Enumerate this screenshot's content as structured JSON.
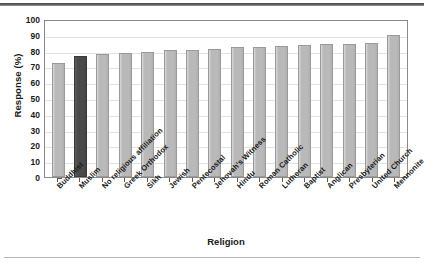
{
  "chart_data": {
    "type": "bar",
    "title": "",
    "xlabel": "Religion",
    "ylabel": "Response (%)",
    "ylim": [
      0,
      100
    ],
    "ytick_step": 10,
    "yticks": [
      100,
      90,
      80,
      70,
      60,
      50,
      40,
      30,
      20,
      10,
      0
    ],
    "grid": true,
    "legend": "none",
    "bar_color": "#b9b9b9",
    "highlight_color": "#4a4a4a",
    "highlight_category": "Muslim",
    "categories": [
      "Buddhist",
      "Muslim",
      "No religious affiliation",
      "Greek Orthodox",
      "Sikh",
      "Jewish",
      "Pentecostal",
      "Jehovah's Witness",
      "Hindu",
      "Roman Catholic",
      "Lutheran",
      "Baptist",
      "Anglican",
      "Presbyterian",
      "United Church",
      "Mennonite"
    ],
    "values": [
      72,
      76.5,
      78,
      78.5,
      79,
      80.5,
      80.5,
      81,
      82,
      82.5,
      83,
      83.5,
      84,
      84.5,
      85,
      90
    ]
  }
}
